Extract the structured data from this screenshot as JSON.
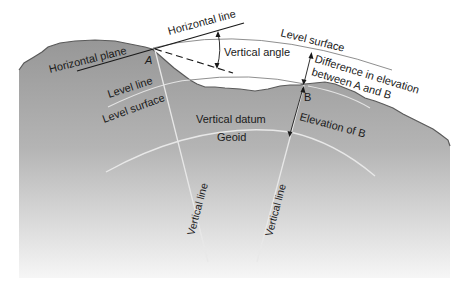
{
  "diagram": {
    "type": "geodesy-elevation-concepts",
    "colors": {
      "terrain_top": "#9a9a9a",
      "terrain_bottom": "#f2f2f2",
      "terrain_edge": "#555555",
      "curve_light": "#e6e6e6",
      "curve_on_white": "#8a8a8a",
      "line_dark": "#1a1a1a",
      "background": "#ffffff"
    },
    "points": {
      "a": "A",
      "b": "B"
    },
    "labels": {
      "horizontal_line": "Horizontal line",
      "horizontal_plane": "Horizontal plane",
      "vertical_angle": "Vertical angle",
      "level_surface_top": "Level surface",
      "difference_line1": "Difference in elevation",
      "difference_line2": "between A and B",
      "level_line": "Level line",
      "level_surface": "Level surface",
      "vertical_datum": "Vertical datum",
      "geoid": "Geoid",
      "elevation_of_b": "Elevation of B",
      "vertical_line_left": "Vertical line",
      "vertical_line_right": "Vertical line"
    }
  }
}
